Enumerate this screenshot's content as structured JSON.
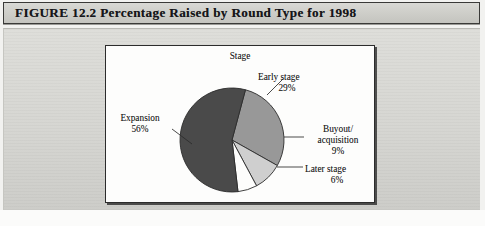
{
  "caption": {
    "label": "FIGURE 12.2  Percentage Raised by Round Type for 1998"
  },
  "labels": {
    "stage": "Stage",
    "early": "Early stage\n29%",
    "early_name": "Early stage",
    "early_pct": "29%",
    "expansion_name": "Expansion",
    "expansion_pct": "56%",
    "buyout_line1": "Buyout/",
    "buyout_line2": "acquisition",
    "buyout_pct": "9%",
    "later_name": "Later stage",
    "later_pct": "6%"
  },
  "colors": {
    "early_stage": "#989898",
    "buyout_acquisition": "#cfcfcf",
    "later_stage": "#fdfdfc",
    "expansion": "#4a4a4a",
    "slice_outline": "#2b2b2b",
    "panel": "#d6d6d2",
    "caption_bar": "#cfcfca",
    "plot_background": "#fdfdfc"
  },
  "chart_data": {
    "type": "pie",
    "title": "Percentage Raised by Round Type for 1998",
    "categories": [
      "Early stage",
      "Buyout/acquisition",
      "Later stage",
      "Expansion"
    ],
    "values": [
      29,
      9,
      6,
      56
    ],
    "value_labels": [
      "29%",
      "9%",
      "6%",
      "56%"
    ],
    "unit": "percent",
    "annotations": [
      "Stage"
    ],
    "legend": "none",
    "labels_position": "outside-with-leader-lines",
    "start_angle_deg": -75,
    "direction": "clockwise",
    "slice_colors": [
      "#989898",
      "#cfcfcf",
      "#fdfdfc",
      "#4a4a4a"
    ]
  }
}
